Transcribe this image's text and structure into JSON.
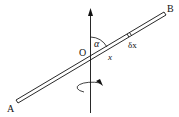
{
  "diagram": {
    "labels": {
      "end_a": "A",
      "end_b": "B",
      "origin": "O",
      "angle": "α",
      "element": "δx",
      "distance": "x"
    },
    "colors": {
      "stroke": "#111111",
      "background": "#ffffff"
    }
  }
}
